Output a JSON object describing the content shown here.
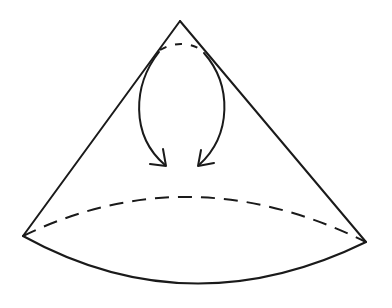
{
  "diagram": {
    "stroke_color": "#1a1a1a",
    "background_color": "#ffffff",
    "apex": [
      180,
      21
    ],
    "base_left": [
      23,
      236
    ],
    "base_right": [
      366,
      242
    ],
    "elements": [
      {
        "name": "cone-left-side",
        "type": "line",
        "style": "solid"
      },
      {
        "name": "cone-right-side",
        "type": "line",
        "style": "solid"
      },
      {
        "name": "base-front-arc",
        "type": "curve",
        "style": "solid"
      },
      {
        "name": "base-back-arc",
        "type": "curve",
        "style": "dashed"
      },
      {
        "name": "apex-small-arc",
        "type": "curve",
        "style": "dashed"
      },
      {
        "name": "left-curved-arrow",
        "type": "arrow",
        "direction": "down"
      },
      {
        "name": "right-curved-arrow",
        "type": "arrow",
        "direction": "down"
      }
    ]
  }
}
